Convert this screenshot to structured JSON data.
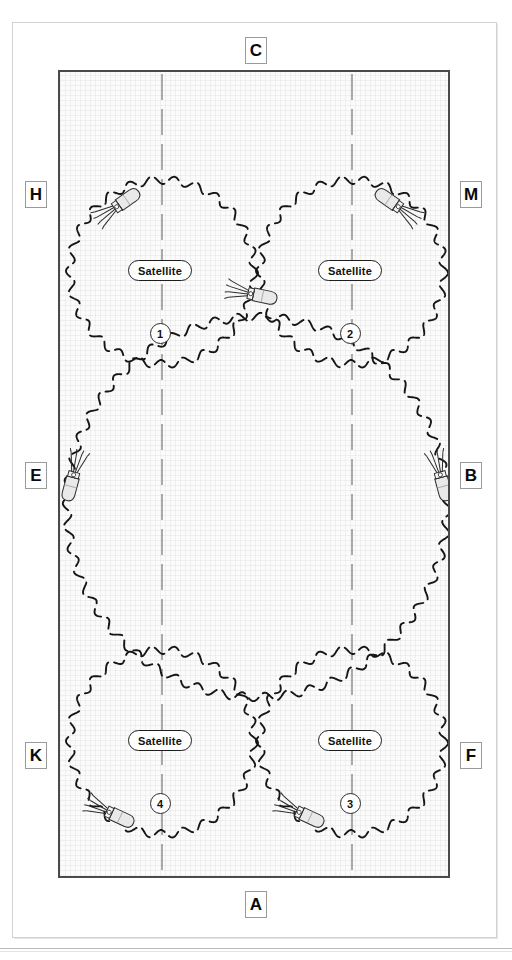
{
  "diagram": {
    "background_color": "#fafafa",
    "border_color": "#4a4a4a",
    "edge_labels": [
      {
        "id": "C",
        "text": "C",
        "position": "top-center"
      },
      {
        "id": "A",
        "text": "A",
        "position": "bottom-center"
      },
      {
        "id": "H",
        "text": "H",
        "position": "left-upper"
      },
      {
        "id": "E",
        "text": "E",
        "position": "left-middle"
      },
      {
        "id": "K",
        "text": "K",
        "position": "left-lower"
      },
      {
        "id": "M",
        "text": "M",
        "position": "right-upper"
      },
      {
        "id": "B",
        "text": "B",
        "position": "right-middle"
      },
      {
        "id": "F",
        "text": "F",
        "position": "right-lower"
      }
    ],
    "footprints": [
      {
        "index": 1,
        "label": "Satellite",
        "number": "1",
        "cx": 102,
        "cy": 200,
        "r": 92,
        "size": "small"
      },
      {
        "index": 2,
        "label": "Satellite",
        "number": "2",
        "cx": 292,
        "cy": 200,
        "r": 92,
        "size": "small"
      },
      {
        "index": 3,
        "label": "Satellite",
        "number": "3",
        "cx": 292,
        "cy": 670,
        "r": 92,
        "size": "small"
      },
      {
        "index": 4,
        "label": "Satellite",
        "number": "4",
        "cx": 102,
        "cy": 670,
        "r": 92,
        "size": "small"
      },
      {
        "index": 5,
        "label": "",
        "number": "",
        "cx": 197,
        "cy": 435,
        "r": 190,
        "size": "large"
      }
    ],
    "guide_lines": [
      {
        "name": "left-axis",
        "x": 102,
        "style": "dashed"
      },
      {
        "name": "right-axis",
        "x": 292,
        "style": "dashed"
      }
    ],
    "satellite_icons": [
      {
        "name": "satellite-icon-top-left",
        "x": 62,
        "y": 131,
        "rot": -35
      },
      {
        "name": "satellite-icon-top-right",
        "x": 333,
        "y": 131,
        "rot": 215
      },
      {
        "name": "satellite-icon-center-top",
        "x": 197,
        "y": 223,
        "rot": 12
      },
      {
        "name": "satellite-icon-left-middle",
        "x": 12,
        "y": 409,
        "rot": 105
      },
      {
        "name": "satellite-icon-right-middle",
        "x": 382,
        "y": 409,
        "rot": 75
      },
      {
        "name": "satellite-icon-bottom-left",
        "x": 55,
        "y": 743,
        "rot": 25
      },
      {
        "name": "satellite-icon-bottom-right",
        "x": 245,
        "y": 743,
        "rot": 25
      }
    ],
    "stroke": {
      "footprint_style": "wavy-dashed",
      "footprint_color": "#151515",
      "guide_color": "#5a5a5a",
      "icon_fill": "#e8e8e8",
      "icon_stroke": "#2b2b2b"
    }
  }
}
